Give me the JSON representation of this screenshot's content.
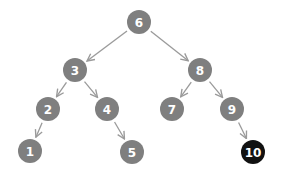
{
  "diagram": {
    "type": "binary-search-tree",
    "colors": {
      "node_fill": "#7f7f7f",
      "highlight_fill": "#111111",
      "edge": "#9a9a9a",
      "label": "#ffffff",
      "background": "#ffffff"
    },
    "nodes": [
      {
        "id": "6",
        "label": "6",
        "x": 139,
        "y": 22,
        "highlighted": false
      },
      {
        "id": "3",
        "label": "3",
        "x": 75,
        "y": 70,
        "highlighted": false
      },
      {
        "id": "8",
        "label": "8",
        "x": 200,
        "y": 70,
        "highlighted": false
      },
      {
        "id": "2",
        "label": "2",
        "x": 48,
        "y": 109,
        "highlighted": false
      },
      {
        "id": "4",
        "label": "4",
        "x": 107,
        "y": 109,
        "highlighted": false
      },
      {
        "id": "7",
        "label": "7",
        "x": 172,
        "y": 109,
        "highlighted": false
      },
      {
        "id": "9",
        "label": "9",
        "x": 232,
        "y": 109,
        "highlighted": false
      },
      {
        "id": "1",
        "label": "1",
        "x": 30,
        "y": 151,
        "highlighted": false
      },
      {
        "id": "5",
        "label": "5",
        "x": 132,
        "y": 152,
        "highlighted": false
      },
      {
        "id": "10",
        "label": "10",
        "x": 253,
        "y": 152,
        "highlighted": true
      }
    ],
    "edges": [
      {
        "from": "6",
        "to": "3"
      },
      {
        "from": "6",
        "to": "8"
      },
      {
        "from": "3",
        "to": "2"
      },
      {
        "from": "3",
        "to": "4"
      },
      {
        "from": "8",
        "to": "7"
      },
      {
        "from": "8",
        "to": "9"
      },
      {
        "from": "2",
        "to": "1"
      },
      {
        "from": "4",
        "to": "5"
      },
      {
        "from": "9",
        "to": "10"
      }
    ]
  }
}
